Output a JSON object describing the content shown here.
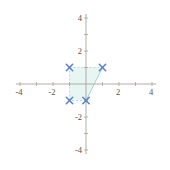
{
  "page": {
    "background": "#ffffff"
  },
  "chart_data": {
    "type": "scatter",
    "title": "",
    "xlabel": "",
    "ylabel": "",
    "xlim": [
      -4,
      4
    ],
    "ylim": [
      -4,
      4
    ],
    "tick_step": 1,
    "x_tick_labels": [
      -4,
      -2,
      2,
      4
    ],
    "y_tick_labels": [
      -4,
      -2,
      2,
      4
    ],
    "grid": false,
    "legend": "none",
    "axis_color": "#a9a49a",
    "tick_color": "#a9a49a",
    "label_color": "#57534c",
    "label_font_size": 8.5,
    "points": [
      {
        "x": -1,
        "y": 1
      },
      {
        "x": 1,
        "y": 1
      },
      {
        "x": 0,
        "y": -1
      },
      {
        "x": -1,
        "y": -1
      }
    ],
    "marker": "x",
    "marker_color": "#5b80c0",
    "marker_size": 3.2,
    "region": {
      "vertices": [
        [
          -1,
          1
        ],
        [
          1,
          1
        ],
        [
          0,
          -1
        ],
        [
          -1,
          -1
        ]
      ],
      "fill": "#e3f3f1",
      "fill_opacity": 0.85,
      "edges": [
        {
          "from": [
            -1,
            1
          ],
          "to": [
            1,
            1
          ],
          "style": "dashed"
        },
        {
          "from": [
            1,
            1
          ],
          "to": [
            0,
            -1
          ],
          "style": "solid"
        },
        {
          "from": [
            0,
            -1
          ],
          "to": [
            -1,
            -1
          ],
          "style": "dashed"
        },
        {
          "from": [
            -1,
            -1
          ],
          "to": [
            -1,
            1
          ],
          "style": "dashed"
        }
      ],
      "edge_color_dashed": "#b4d9d6",
      "edge_color_solid": "#9ecfca",
      "edge_dash": "2,2"
    },
    "layout": {
      "origin_px": [
        86,
        84
      ],
      "px_per_unit": 16.5,
      "axis_overhang_units": 0.25,
      "tick_half_len": 2
    }
  }
}
